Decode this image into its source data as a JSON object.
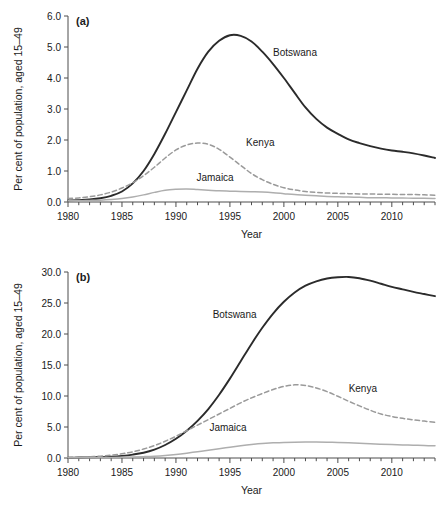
{
  "figure": {
    "panels": [
      {
        "letter": "(a)",
        "xlabel": "Year",
        "ylabel": "Per cent of population, aged 15–49",
        "ylim": [
          0,
          6
        ],
        "yticks": [
          "0.0",
          "1.0",
          "2.0",
          "3.0",
          "4.0",
          "5.0",
          "6.0"
        ],
        "ytick_values": [
          0,
          1,
          2,
          3,
          4,
          5,
          6
        ],
        "xlim": [
          1980,
          2014
        ],
        "xticks": [
          "1980",
          "1985",
          "1990",
          "1995",
          "2000",
          "2005",
          "2010"
        ],
        "xtick_values": [
          1980,
          1985,
          1990,
          1995,
          2000,
          2005,
          2010
        ],
        "labels": [
          {
            "text": "Botswana",
            "x": 1999.0,
            "y": 4.72
          },
          {
            "text": "Kenya",
            "x": 1996.5,
            "y": 1.82
          },
          {
            "text": "Jamaica",
            "x": 1991.9,
            "y": 0.68
          }
        ]
      },
      {
        "letter": "(b)",
        "xlabel": "Year",
        "ylabel": "Per cent of population, aged 15–49",
        "ylim": [
          0,
          30
        ],
        "yticks": [
          "0.0",
          "5.0",
          "10.0",
          "15.0",
          "20.0",
          "25.0",
          "30.0"
        ],
        "ytick_values": [
          0,
          5,
          10,
          15,
          20,
          25,
          30
        ],
        "xlim": [
          1980,
          2014
        ],
        "xticks": [
          "1980",
          "1985",
          "1990",
          "1995",
          "2000",
          "2005",
          "2010"
        ],
        "xtick_values": [
          1980,
          1985,
          1990,
          1995,
          2000,
          2005,
          2010
        ],
        "labels": [
          {
            "text": "Botswana",
            "x": 1993.4,
            "y": 22.6
          },
          {
            "text": "Kenya",
            "x": 2006.0,
            "y": 10.7
          },
          {
            "text": "Jamaica",
            "x": 1993.1,
            "y": 4.35
          }
        ]
      }
    ]
  },
  "colors": {
    "botswana": "#2b2b2b",
    "kenya": "#9a9a9a",
    "jamaica": "#aeaeae",
    "axis": "#4d4d4d",
    "text": "#1a1a1a",
    "background": "#ffffff"
  },
  "chart_data": [
    {
      "type": "line",
      "title": "(a)",
      "xlabel": "Year",
      "ylabel": "Per cent of population, aged 15–49",
      "xlim": [
        1980,
        2014
      ],
      "ylim": [
        0,
        6
      ],
      "grid": false,
      "legend": "inline-labels",
      "x": [
        1980,
        1981,
        1982,
        1983,
        1984,
        1985,
        1986,
        1987,
        1988,
        1989,
        1990,
        1991,
        1992,
        1993,
        1994,
        1995,
        1996,
        1997,
        1998,
        1999,
        2000,
        2001,
        2002,
        2003,
        2004,
        2005,
        2006,
        2007,
        2008,
        2009,
        2010,
        2011,
        2012,
        2013,
        2014
      ],
      "series": [
        {
          "name": "Botswana",
          "style": "solid",
          "color": "#2b2b2b",
          "values": [
            0.05,
            0.06,
            0.08,
            0.12,
            0.2,
            0.34,
            0.6,
            1.0,
            1.55,
            2.2,
            2.9,
            3.6,
            4.3,
            4.85,
            5.2,
            5.38,
            5.36,
            5.18,
            4.85,
            4.45,
            4.0,
            3.52,
            3.05,
            2.68,
            2.4,
            2.2,
            2.02,
            1.9,
            1.8,
            1.72,
            1.66,
            1.62,
            1.57,
            1.5,
            1.42
          ]
        },
        {
          "name": "Kenya",
          "style": "dashed",
          "color": "#9a9a9a",
          "values": [
            0.11,
            0.13,
            0.17,
            0.23,
            0.32,
            0.45,
            0.62,
            0.85,
            1.12,
            1.42,
            1.68,
            1.84,
            1.9,
            1.86,
            1.7,
            1.45,
            1.18,
            0.92,
            0.72,
            0.57,
            0.46,
            0.39,
            0.34,
            0.31,
            0.29,
            0.28,
            0.27,
            0.26,
            0.26,
            0.25,
            0.25,
            0.24,
            0.24,
            0.23,
            0.22
          ]
        },
        {
          "name": "Jamaica",
          "style": "solid",
          "color": "#aeaeae",
          "values": [
            0.04,
            0.04,
            0.05,
            0.06,
            0.08,
            0.11,
            0.16,
            0.23,
            0.31,
            0.38,
            0.41,
            0.42,
            0.4,
            0.38,
            0.36,
            0.35,
            0.34,
            0.33,
            0.32,
            0.3,
            0.27,
            0.24,
            0.22,
            0.2,
            0.18,
            0.17,
            0.16,
            0.15,
            0.14,
            0.14,
            0.13,
            0.13,
            0.12,
            0.12,
            0.11
          ]
        }
      ]
    },
    {
      "type": "line",
      "title": "(b)",
      "xlabel": "Year",
      "ylabel": "Per cent of population, aged 15–49",
      "xlim": [
        1980,
        2014
      ],
      "ylim": [
        0,
        30
      ],
      "grid": false,
      "legend": "inline-labels",
      "x": [
        1980,
        1981,
        1982,
        1983,
        1984,
        1985,
        1986,
        1987,
        1988,
        1989,
        1990,
        1991,
        1992,
        1993,
        1994,
        1995,
        1996,
        1997,
        1998,
        1999,
        2000,
        2001,
        2002,
        2003,
        2004,
        2005,
        2006,
        2007,
        2008,
        2009,
        2010,
        2011,
        2012,
        2013,
        2014
      ],
      "series": [
        {
          "name": "Botswana",
          "style": "solid",
          "color": "#2b2b2b",
          "values": [
            0.05,
            0.07,
            0.1,
            0.15,
            0.22,
            0.35,
            0.55,
            0.85,
            1.35,
            2.1,
            3.1,
            4.4,
            6.0,
            7.9,
            10.2,
            12.8,
            15.6,
            18.4,
            21.0,
            23.3,
            25.2,
            26.7,
            27.8,
            28.5,
            28.95,
            29.15,
            29.2,
            29.0,
            28.6,
            28.1,
            27.6,
            27.2,
            26.8,
            26.45,
            26.1
          ]
        },
        {
          "name": "Kenya",
          "style": "dashed",
          "color": "#9a9a9a",
          "values": [
            0.1,
            0.14,
            0.2,
            0.3,
            0.45,
            0.68,
            1.0,
            1.45,
            2.0,
            2.7,
            3.5,
            4.4,
            5.3,
            6.2,
            7.1,
            8.0,
            8.9,
            9.7,
            10.4,
            11.05,
            11.55,
            11.8,
            11.7,
            11.3,
            10.7,
            9.95,
            9.15,
            8.4,
            7.7,
            7.1,
            6.7,
            6.4,
            6.15,
            5.95,
            5.75
          ]
        },
        {
          "name": "Jamaica",
          "style": "solid",
          "color": "#aeaeae",
          "values": [
            0.03,
            0.04,
            0.05,
            0.07,
            0.09,
            0.12,
            0.16,
            0.22,
            0.3,
            0.42,
            0.58,
            0.78,
            1.0,
            1.25,
            1.5,
            1.75,
            1.98,
            2.18,
            2.33,
            2.44,
            2.52,
            2.56,
            2.58,
            2.58,
            2.55,
            2.5,
            2.44,
            2.37,
            2.3,
            2.23,
            2.17,
            2.11,
            2.06,
            2.01,
            1.97
          ]
        }
      ]
    }
  ]
}
